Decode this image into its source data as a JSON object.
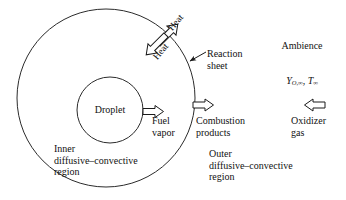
{
  "figure": {
    "background_color": "#ffffff",
    "line_color": "#1a1a1a"
  },
  "geometry": {
    "outer_circle": {
      "cx": 106,
      "cy": 98,
      "r": 89,
      "name": "reaction-sheet-circle"
    },
    "inner_circle": {
      "cx": 110,
      "cy": 110,
      "r": 33,
      "name": "droplet-circle"
    }
  },
  "labels": {
    "droplet": "Droplet",
    "fuel_vapor": "Fuel\nvapor",
    "combustion_products": "Combustion\nproducts",
    "oxidizer_gas": "Oxidizer\ngas",
    "reaction_sheet": "Reaction\nsheet",
    "ambience": "Ambience",
    "heat_outward": "Heat",
    "heat_inward": "Heat",
    "inner_region": "Inner\ndiffusive–convective\nregion",
    "outer_region": "Outer\ndiffusive–convective\nregion"
  },
  "formulas": {
    "ambience_conditions": {
      "oxidizer_mass_fraction": "Y",
      "oxidizer_subscript": "O,∞",
      "separator": ", ",
      "temperature": "T",
      "temperature_subscript": "∞"
    }
  },
  "arrows": [
    {
      "name": "fuel-vapor-arrow",
      "direction": "right",
      "style": "hollow",
      "label": "Fuel vapor"
    },
    {
      "name": "combustion-products-arrow",
      "direction": "right",
      "style": "hollow",
      "label": "Combustion products"
    },
    {
      "name": "oxidizer-gas-arrow",
      "direction": "left",
      "style": "hollow",
      "label": "Oxidizer gas"
    },
    {
      "name": "heat-outward-arrow",
      "direction": "up-right",
      "style": "hollow",
      "label": "Heat"
    },
    {
      "name": "heat-inward-arrow",
      "direction": "down-left",
      "style": "hollow",
      "label": "Heat"
    },
    {
      "name": "reaction-sheet-pointer",
      "direction": "down-left",
      "style": "solid-thin",
      "label": "Reaction sheet"
    }
  ]
}
